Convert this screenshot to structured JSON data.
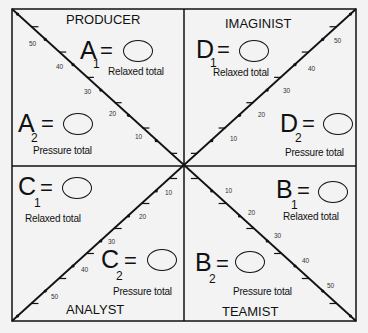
{
  "quadrants": {
    "producer": {
      "title": "PRODUCER",
      "letter": "A",
      "relaxed_sub": "1",
      "pressure_sub": "2",
      "relaxed_label": "Relaxed total",
      "pressure_label": "Pressure total",
      "eq": "="
    },
    "imaginist": {
      "title": "IMAGINIST",
      "letter": "D",
      "relaxed_sub": "1",
      "pressure_sub": "2",
      "relaxed_label": "Relaxed total",
      "pressure_label": "Pressure total",
      "eq": "="
    },
    "analyst": {
      "title": "ANALYST",
      "letter": "C",
      "relaxed_sub": "1",
      "pressure_sub": "2",
      "relaxed_label": "Relaxed total",
      "pressure_label": "Pressure total",
      "eq": "="
    },
    "teamist": {
      "title": "TEAMIST",
      "letter": "B",
      "relaxed_sub": "1",
      "pressure_sub": "2",
      "relaxed_label": "Relaxed total",
      "pressure_label": "Pressure total",
      "eq": "="
    }
  },
  "scale_labels": [
    "10",
    "20",
    "30",
    "40",
    "50"
  ]
}
